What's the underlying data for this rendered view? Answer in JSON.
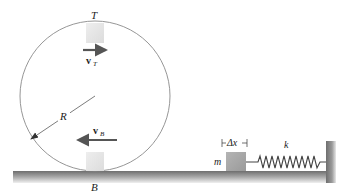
{
  "diagram": {
    "labels": {
      "top": "T",
      "bottom": "B",
      "radius": "R",
      "v_top": "v",
      "v_top_sub": "T",
      "v_bottom": "v",
      "v_bottom_sub": "B",
      "mass": "m",
      "compression": "Δx",
      "spring_constant": "k"
    },
    "colors": {
      "circle": "#8a8a8a",
      "block": "#e8e8e8",
      "mass_block": "#a8a8a8",
      "arrow": "#555555",
      "ground_top": "#7a7a7a",
      "ground_bottom": "#e6e6e6",
      "spring": "#444444"
    }
  }
}
